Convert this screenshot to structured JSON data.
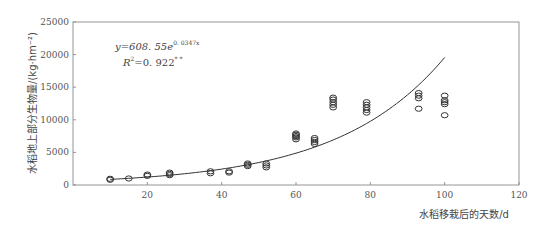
{
  "chart_data": {
    "type": "scatter",
    "title": "",
    "xlabel": "水稻移栽后的天数/d",
    "ylabel": "水稻地上部分生物量/(kg·hm⁻²)",
    "xlim": [
      0,
      120
    ],
    "ylim": [
      0,
      25000
    ],
    "x_ticks": [
      20,
      40,
      60,
      80,
      100,
      120
    ],
    "x_tick_labels": [
      "20",
      "40",
      "60",
      "80",
      "100",
      "120"
    ],
    "y_ticks": [
      0,
      5000,
      10000,
      15000,
      20000,
      25000
    ],
    "y_tick_labels": [
      "0",
      "5000",
      "10000",
      "15000",
      "20000",
      "25000"
    ],
    "grid": false,
    "legend": null,
    "annotations": {
      "equation_prefix": "y=608. 55e",
      "equation_exponent": "0. 0347x",
      "r2_prefix": "R",
      "r2_sup": "2",
      "r2_value": "=0. 922",
      "r2_significance": "* *"
    },
    "fit": {
      "type": "exponential",
      "a": 608.55,
      "b": 0.0347,
      "x_range": [
        10,
        100
      ]
    },
    "series": [
      {
        "name": "observed",
        "marker": "open-circle",
        "points": [
          [
            10,
            800
          ],
          [
            10,
            950
          ],
          [
            15,
            1000
          ],
          [
            20,
            1400
          ],
          [
            20,
            1600
          ],
          [
            26,
            1500
          ],
          [
            26,
            1700
          ],
          [
            26,
            1900
          ],
          [
            37,
            1800
          ],
          [
            37,
            2100
          ],
          [
            42,
            1900
          ],
          [
            42,
            2100
          ],
          [
            47,
            2900
          ],
          [
            47,
            3100
          ],
          [
            47,
            3300
          ],
          [
            52,
            2700
          ],
          [
            52,
            3000
          ],
          [
            52,
            3300
          ],
          [
            60,
            7000
          ],
          [
            60,
            7300
          ],
          [
            60,
            7500
          ],
          [
            60,
            7700
          ],
          [
            60,
            7900
          ],
          [
            65,
            6300
          ],
          [
            65,
            6600
          ],
          [
            65,
            6900
          ],
          [
            65,
            7200
          ],
          [
            70,
            11900
          ],
          [
            70,
            12300
          ],
          [
            70,
            12700
          ],
          [
            70,
            13100
          ],
          [
            70,
            13400
          ],
          [
            79,
            11100
          ],
          [
            79,
            11500
          ],
          [
            79,
            11900
          ],
          [
            79,
            12300
          ],
          [
            79,
            12700
          ],
          [
            93,
            11700
          ],
          [
            93,
            13300
          ],
          [
            93,
            13700
          ],
          [
            93,
            14100
          ],
          [
            100,
            10700
          ],
          [
            100,
            12400
          ],
          [
            100,
            12700
          ],
          [
            100,
            13000
          ],
          [
            100,
            13700
          ]
        ]
      }
    ]
  }
}
